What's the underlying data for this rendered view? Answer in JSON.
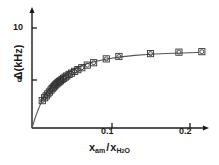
{
  "figure": {
    "background_color": "#ffffff",
    "ink_color": "#1a1a1a",
    "curve_color": "#555555"
  },
  "axes": {
    "y_title_symbol": "Δ",
    "y_title_units": "(kHz)",
    "x_title_main": "x",
    "x_title_main_sub": "am",
    "x_title_separator": "/",
    "x_title_denom": "x",
    "x_title_denom_sub_a": "H",
    "x_title_denom_sub_num": "2",
    "x_title_denom_sub_b": "O",
    "y_ticks": [
      {
        "value": 5,
        "label": "5"
      },
      {
        "value": 10,
        "label": "10"
      }
    ],
    "x_ticks": [
      {
        "value": 0.1,
        "label": "0.1"
      },
      {
        "value": 0.2,
        "label": "0.2"
      }
    ],
    "xlim": [
      0.0,
      0.228
    ],
    "ylim": [
      0.0,
      11.6
    ],
    "grid": false,
    "legend": null
  },
  "chart_data": {
    "type": "scatter",
    "title": "",
    "xlabel": "x_am / x_H2O",
    "ylabel": "Δ (kHz)",
    "xlim": [
      0.0,
      0.228
    ],
    "ylim": [
      0.0,
      11.6
    ],
    "grid": false,
    "legend_position": "none",
    "marker_style": "open-square-with-circle",
    "series": [
      {
        "name": "measured",
        "x": [
          0.013,
          0.016,
          0.018,
          0.02,
          0.022,
          0.024,
          0.0255,
          0.027,
          0.0285,
          0.03,
          0.0315,
          0.033,
          0.0345,
          0.036,
          0.038,
          0.04,
          0.042,
          0.044,
          0.047,
          0.05,
          0.054,
          0.058,
          0.063,
          0.07,
          0.078,
          0.094,
          0.11,
          0.15,
          0.186,
          0.215
        ],
        "y": [
          2.85,
          3.15,
          3.35,
          3.55,
          3.75,
          3.95,
          4.1,
          4.25,
          4.38,
          4.5,
          4.62,
          4.73,
          4.83,
          4.92,
          5.05,
          5.18,
          5.3,
          5.42,
          5.58,
          5.72,
          5.9,
          6.08,
          6.28,
          6.55,
          6.8,
          7.2,
          7.45,
          7.75,
          7.9,
          7.95
        ]
      }
    ],
    "fit_curve": {
      "name": "saturation fit",
      "x": [
        0.0,
        0.004,
        0.008,
        0.012,
        0.016,
        0.02,
        0.025,
        0.03,
        0.035,
        0.04,
        0.046,
        0.052,
        0.06,
        0.07,
        0.08,
        0.095,
        0.11,
        0.13,
        0.15,
        0.17,
        0.19,
        0.21
      ],
      "y": [
        0.0,
        1.05,
        1.95,
        2.72,
        3.35,
        3.88,
        4.42,
        4.86,
        5.22,
        5.53,
        5.85,
        6.11,
        6.41,
        6.7,
        6.93,
        7.19,
        7.38,
        7.56,
        7.68,
        7.76,
        7.82,
        7.86
      ]
    }
  }
}
